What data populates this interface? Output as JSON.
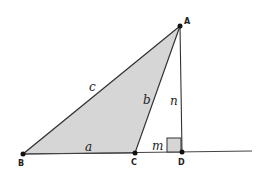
{
  "diagram": {
    "type": "geometry-triangle-with-altitude",
    "colors": {
      "fill": "#d6d6d6",
      "stroke": "#333333",
      "point": "#111111",
      "background": "#ffffff"
    },
    "points": {
      "A": {
        "label": "A",
        "x": 180,
        "y": 26
      },
      "B": {
        "label": "B",
        "x": 23,
        "y": 154
      },
      "C": {
        "label": "C",
        "x": 135,
        "y": 153
      },
      "D": {
        "label": "D",
        "x": 182,
        "y": 152
      }
    },
    "baseline": {
      "x1": 23,
      "y1": 154,
      "x2": 252,
      "y2": 151
    },
    "shaded_triangle": [
      "A",
      "B",
      "C"
    ],
    "altitude": {
      "from": "A",
      "to": "D"
    },
    "right_angle_marker": {
      "at": "D",
      "size": 14
    },
    "side_labels": {
      "a": {
        "text": "a",
        "x": 85,
        "y": 150
      },
      "b": {
        "text": "b",
        "x": 144,
        "y": 104
      },
      "c": {
        "text": "c",
        "x": 90,
        "y": 91
      },
      "n": {
        "text": "n",
        "x": 171,
        "y": 105
      },
      "m": {
        "text": "m",
        "x": 151,
        "y": 149
      }
    }
  }
}
